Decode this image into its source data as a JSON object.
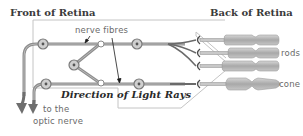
{
  "diagram": {
    "titles": {
      "front": "Front of Retina",
      "back": "Back of Retina"
    },
    "labels": {
      "nerve_fibres": "nerve fibres",
      "rods": "rods",
      "cone": "cone",
      "optic_nerve_line1": "to the",
      "optic_nerve_line2": "optic nerve",
      "direction": "Direction of Light Rays"
    },
    "colors": {
      "fibre": "#8a8a8a",
      "fibre_dark": "#5a5a5a",
      "cell_fill": "#c8c8c8",
      "receptor_fill": "#b4b4b4",
      "outline": "#9a9a9a",
      "arrow": "#6e6e6e",
      "box": "#bdbdbd"
    },
    "photoreceptors": [
      {
        "type": "rod",
        "y": 45
      },
      {
        "type": "rod",
        "y": 58
      },
      {
        "type": "rod",
        "y": 71
      },
      {
        "type": "cone",
        "y": 84
      }
    ]
  }
}
